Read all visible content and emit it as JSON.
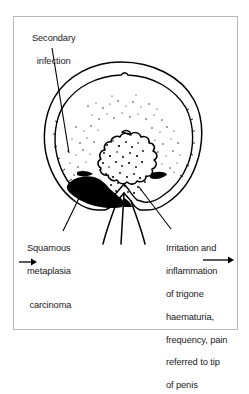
{
  "figure": {
    "background_color": "#ffffff",
    "frame_color": "#b8b8b8",
    "ink_color": "#000000"
  },
  "annotations": {
    "secondary_infection": {
      "name": "secondary-infection",
      "lines": [
        "Secondary",
        "infection"
      ],
      "text": "Secondary\ninfection"
    },
    "squamous_metaplasia": {
      "name": "squamous-metaplasia-carcinoma",
      "line1": "Squamous",
      "line2": "metaplasia",
      "arrow_glyph": "→",
      "line3": "carcinoma",
      "text": "Squamous\nmetaplasia\n→ carcinoma"
    },
    "trigone_irritation": {
      "name": "trigone-irritation",
      "line1": "Irritation and",
      "line2": "inflammation",
      "line3": "of trigone",
      "arrow_glyph": "→",
      "line4": "haematuria,",
      "line5": "frequency, pain",
      "line6": "referred to tip",
      "line7": "of penis",
      "text": "Irritation and\ninflammation\nof trigone →\nhaematuria,\nfrequency, pain\nreferred to tip\nof penis"
    }
  },
  "anatomy": {
    "bladder_outer_wall": "bladder-outer-wall",
    "bladder_inner_wall": "bladder-inner-wall",
    "tumour_mass": "papillary-tumour-mass",
    "trigone_lesion": "black-trigone-lesion",
    "urethra": "urethra",
    "stipple": "infection-stipple-dots"
  }
}
